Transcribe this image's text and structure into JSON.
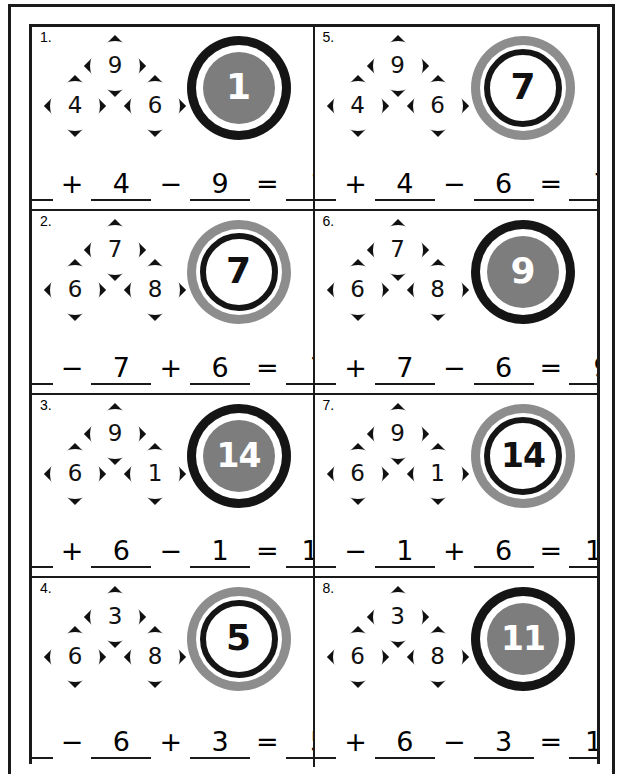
{
  "worksheet": {
    "layout": {
      "columns": 2,
      "rows": 4
    },
    "problems": [
      {
        "number": "1.",
        "diamonds": {
          "top": "9",
          "left": "4",
          "right": "6"
        },
        "answer": "1",
        "badge_style": "style-dark",
        "equation": {
          "a": "6",
          "op1": "+",
          "b": "4",
          "op2": "−",
          "c": "9",
          "equals": "=",
          "result": "1"
        }
      },
      {
        "number": "5.",
        "diamonds": {
          "top": "9",
          "left": "4",
          "right": "6"
        },
        "answer": "7",
        "badge_style": "style-light",
        "equation": {
          "a": "9",
          "op1": "+",
          "b": "4",
          "op2": "−",
          "c": "6",
          "equals": "=",
          "result": "7"
        }
      },
      {
        "number": "2.",
        "diamonds": {
          "top": "7",
          "left": "6",
          "right": "8"
        },
        "answer": "7",
        "badge_style": "style-light",
        "equation": {
          "a": "8",
          "op1": "−",
          "b": "7",
          "op2": "+",
          "c": "6",
          "equals": "=",
          "result": "7"
        }
      },
      {
        "number": "6.",
        "diamonds": {
          "top": "7",
          "left": "6",
          "right": "8"
        },
        "answer": "9",
        "badge_style": "style-dark",
        "equation": {
          "a": "8",
          "op1": "+",
          "b": "7",
          "op2": "−",
          "c": "6",
          "equals": "=",
          "result": "9"
        }
      },
      {
        "number": "3.",
        "diamonds": {
          "top": "9",
          "left": "6",
          "right": "1"
        },
        "answer": "14",
        "badge_style": "style-dark",
        "equation": {
          "a": "9",
          "op1": "+",
          "b": "6",
          "op2": "−",
          "c": "1",
          "equals": "=",
          "result": "14"
        }
      },
      {
        "number": "7.",
        "diamonds": {
          "top": "9",
          "left": "6",
          "right": "1"
        },
        "answer": "14",
        "badge_style": "style-light",
        "equation": {
          "a": "9",
          "op1": "−",
          "b": "1",
          "op2": "+",
          "c": "6",
          "equals": "=",
          "result": "14"
        }
      },
      {
        "number": "4.",
        "diamonds": {
          "top": "3",
          "left": "6",
          "right": "8"
        },
        "answer": "5",
        "badge_style": "style-light",
        "equation": {
          "a": "8",
          "op1": "−",
          "b": "6",
          "op2": "+",
          "c": "3",
          "equals": "=",
          "result": "5"
        }
      },
      {
        "number": "8.",
        "diamonds": {
          "top": "3",
          "left": "6",
          "right": "8"
        },
        "answer": "11",
        "badge_style": "style-dark",
        "equation": {
          "a": "8",
          "op1": "+",
          "b": "6",
          "op2": "−",
          "c": "3",
          "equals": "=",
          "result": "11"
        }
      }
    ]
  },
  "colors": {
    "ink": "#151515",
    "gray_fill": "#7d7d7d",
    "gray_ring": "#8d8d8d",
    "paper": "#ffffff"
  }
}
